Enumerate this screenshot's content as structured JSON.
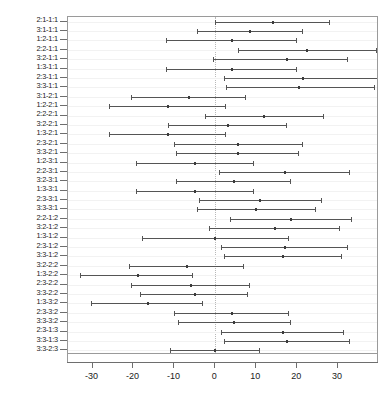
{
  "chart_data": {
    "type": "scatter",
    "title": "",
    "subtitle": "",
    "xlabel": "",
    "ylabel": "",
    "xlim": [
      -36,
      40
    ],
    "ylim": [
      0,
      36
    ],
    "grid": true,
    "legend": null,
    "reference_line": 0,
    "xticks": [
      -30,
      -20,
      -10,
      0,
      10,
      20,
      30
    ],
    "xticklabels": [
      "-30",
      "-20",
      "-10",
      "0",
      "10",
      "20",
      "30"
    ],
    "note": "Horizontal confidence-interval plot (Tukey-style pairwise differences). Each row shows lower bound, point estimate (difference of means) and upper bound.",
    "series_name": "difference in mean levels",
    "categories": [
      "2:1-1:1",
      "3:1-1:1",
      "1:2-1:1",
      "2:2-1:1",
      "3:2-1:1",
      "1:3-1:1",
      "2:3-1:1",
      "3:3-1:1",
      "3:1-2:1",
      "1:2-2:1",
      "2:2-2:1",
      "3:2-2:1",
      "1:3-2:1",
      "2:3-2:1",
      "3:3-2:1",
      "1:2-3:1",
      "2:2-3:1",
      "3:2-3:1",
      "1:3-3:1",
      "2:3-3:1",
      "3:3-3:1",
      "2:2-1:2",
      "3:2-1:2",
      "1:3-1:2",
      "2:3-1:2",
      "3:3-1:2",
      "3:2-2:2",
      "1:3-2:2",
      "2:3-2:2",
      "3:3-2:2",
      "1:3-3:2",
      "2:3-3:2",
      "3:3-3:2",
      "2:3-1:3",
      "3:3-1:3",
      "3:3-2:3"
    ],
    "lower": [
      0.0,
      -4.5,
      -12.0,
      5.5,
      -0.5,
      -12.0,
      2.0,
      2.5,
      -20.5,
      -26.0,
      -2.5,
      -11.5,
      -26.0,
      -10.0,
      -9.5,
      -19.5,
      1.0,
      -9.5,
      -19.5,
      -4.0,
      -4.5,
      3.5,
      -1.5,
      -18.0,
      1.5,
      2.0,
      -21.0,
      -33.0,
      -20.5,
      -18.5,
      -30.5,
      -10.0,
      -9.0,
      1.5,
      2.0,
      -11.0
    ],
    "estimate": [
      14.0,
      8.5,
      4.0,
      22.5,
      17.5,
      4.0,
      21.5,
      20.5,
      -6.5,
      -11.5,
      12.0,
      3.0,
      -11.5,
      5.5,
      5.5,
      -5.0,
      17.0,
      4.5,
      -5.0,
      11.0,
      10.0,
      18.5,
      14.5,
      0.0,
      17.0,
      16.5,
      -7.0,
      -19.0,
      -6.0,
      -5.0,
      -16.5,
      4.0,
      4.5,
      16.5,
      17.5,
      0.0
    ],
    "upper": [
      28.0,
      21.5,
      20.0,
      39.5,
      32.5,
      20.0,
      40.5,
      39.0,
      7.5,
      2.5,
      26.5,
      17.5,
      2.5,
      21.5,
      20.5,
      9.5,
      33.0,
      18.5,
      9.5,
      26.0,
      24.5,
      33.5,
      30.5,
      18.0,
      32.5,
      31.0,
      7.0,
      -5.5,
      8.5,
      8.0,
      -3.0,
      18.0,
      18.5,
      31.5,
      33.0,
      11.0
    ]
  }
}
